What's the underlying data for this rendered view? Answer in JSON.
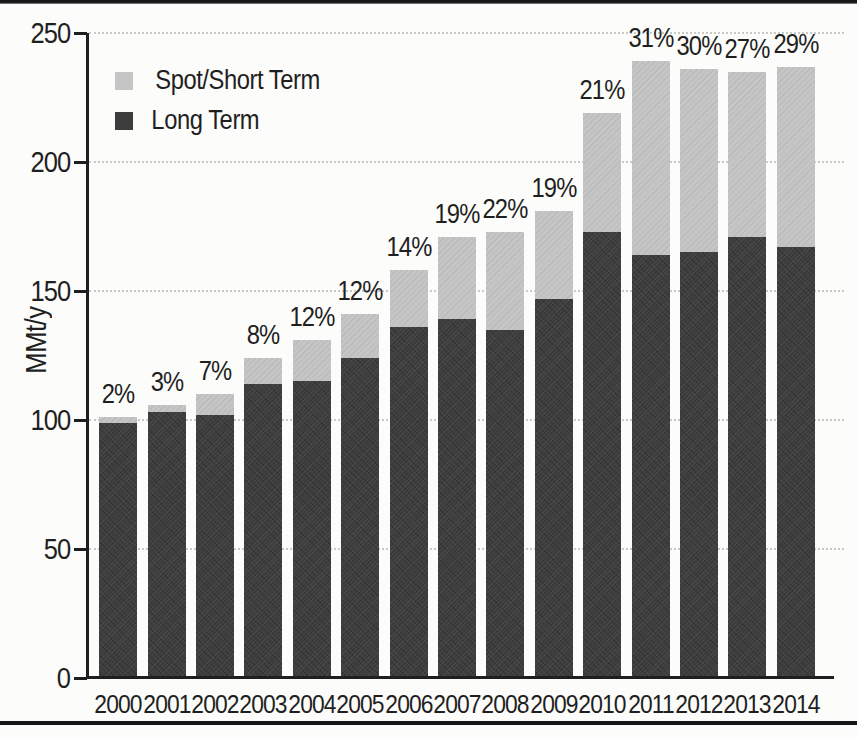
{
  "colors": {
    "background": "#fcfcfa",
    "text": "#1f1f1f",
    "axis": "#1f1f1f",
    "gridline": "#c9c9c9",
    "spot_short_term": "#c5c5c5",
    "long_term": "#3d3d3d",
    "page_rule": "#151515"
  },
  "chart_data": {
    "type": "bar",
    "stacked": true,
    "title": "",
    "xlabel": "",
    "ylabel": "MMt/y",
    "ylim": [
      0,
      250
    ],
    "yticks": [
      0,
      50,
      100,
      150,
      200,
      250
    ],
    "grid": "horizontal-dashed",
    "categories": [
      "2000",
      "2001",
      "2002",
      "2003",
      "2004",
      "2005",
      "2006",
      "2007",
      "2008",
      "2009",
      "2010",
      "2011",
      "2012",
      "2013",
      "2014"
    ],
    "series": [
      {
        "name": "Long Term",
        "color": "#3d3d3d",
        "values": [
          99,
          103,
          102,
          114,
          115,
          124,
          136,
          139,
          135,
          147,
          173,
          164,
          165,
          171,
          167
        ]
      },
      {
        "name": "Spot/Short Term",
        "color": "#c5c5c5",
        "values": [
          2,
          3,
          8,
          10,
          16,
          17,
          22,
          32,
          38,
          34,
          46,
          75,
          71,
          64,
          70
        ]
      }
    ],
    "totals": [
      101,
      106,
      110,
      124,
      131,
      141,
      158,
      171,
      173,
      181,
      219,
      239,
      236,
      235,
      237
    ],
    "bar_labels": [
      "2%",
      "3%",
      "7%",
      "8%",
      "12%",
      "12%",
      "14%",
      "19%",
      "22%",
      "19%",
      "21%",
      "31%",
      "30%",
      "27%",
      "29%"
    ],
    "legend": {
      "position": "top-left",
      "entries": [
        {
          "label": "Spot/Short Term",
          "color": "#c5c5c5"
        },
        {
          "label": "Long Term",
          "color": "#3d3d3d"
        }
      ]
    }
  }
}
